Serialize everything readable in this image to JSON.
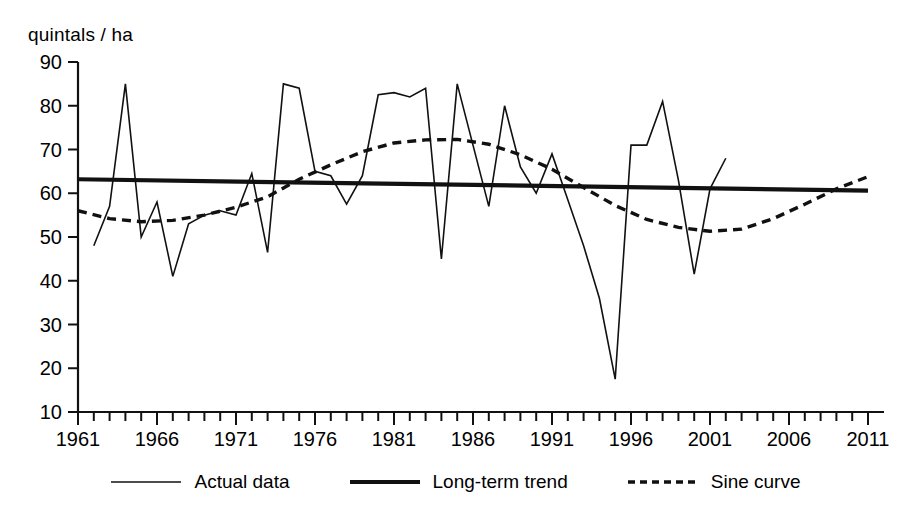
{
  "chart_data": {
    "type": "line",
    "title": "",
    "xlabel": "",
    "ylabel": "quintals / ha",
    "ylim": [
      10,
      90
    ],
    "xlim": [
      1961,
      2011
    ],
    "ytick_values": [
      90,
      80,
      70,
      60,
      50,
      40,
      30,
      20,
      10
    ],
    "xtick_values": [
      1961,
      1966,
      1971,
      1976,
      1981,
      1986,
      1991,
      1996,
      2001,
      2006,
      2011
    ],
    "xtick_step_minor": 1,
    "grid": false,
    "legend_position": "bottom",
    "series": [
      {
        "name": "Actual data",
        "style": "thin-solid",
        "x": [
          1962,
          1963,
          1964,
          1965,
          1966,
          1967,
          1968,
          1969,
          1970,
          1971,
          1972,
          1973,
          1974,
          1975,
          1976,
          1977,
          1978,
          1979,
          1980,
          1981,
          1982,
          1983,
          1984,
          1985,
          1986,
          1987,
          1988,
          1989,
          1990,
          1991,
          1992,
          1993,
          1994,
          1995,
          1996,
          1997,
          1998,
          1999,
          2000,
          2001,
          2002
        ],
        "values": [
          48,
          57,
          85,
          50,
          58,
          41,
          53,
          55,
          56,
          55,
          64.5,
          46.5,
          85,
          84,
          65,
          64,
          57.5,
          64,
          82.5,
          83,
          82,
          84,
          45,
          85,
          71,
          57,
          80,
          66,
          60,
          69,
          58.5,
          48,
          36,
          17.5,
          71,
          71,
          81,
          63,
          41.5,
          61,
          68
        ]
      },
      {
        "name": "Long-term trend",
        "style": "thick-solid",
        "x": [
          1961,
          2011
        ],
        "values": [
          63.2,
          60.6
        ]
      },
      {
        "name": "Sine curve",
        "style": "dashed",
        "x": [
          1961,
          1963,
          1965,
          1967,
          1969,
          1971,
          1973,
          1975,
          1977,
          1979,
          1981,
          1983,
          1985,
          1987,
          1989,
          1991,
          1993,
          1995,
          1997,
          1999,
          2001,
          2003,
          2005,
          2007,
          2009,
          2011
        ],
        "values": [
          56,
          54.2,
          53.5,
          53.8,
          55,
          56.8,
          59.2,
          63.2,
          66.5,
          69.5,
          71.5,
          72.2,
          72.3,
          71.2,
          68.8,
          65.5,
          61.3,
          57.2,
          54,
          52.2,
          51.3,
          51.8,
          54.2,
          57.5,
          61,
          63.8
        ]
      }
    ]
  },
  "axis": {
    "unit_label": "quintals / ha"
  },
  "legend": {
    "items": [
      {
        "label": "Actual data",
        "style": "thin-solid"
      },
      {
        "label": "Long-term trend",
        "style": "thick-solid"
      },
      {
        "label": "Sine curve",
        "style": "dashed"
      }
    ]
  }
}
